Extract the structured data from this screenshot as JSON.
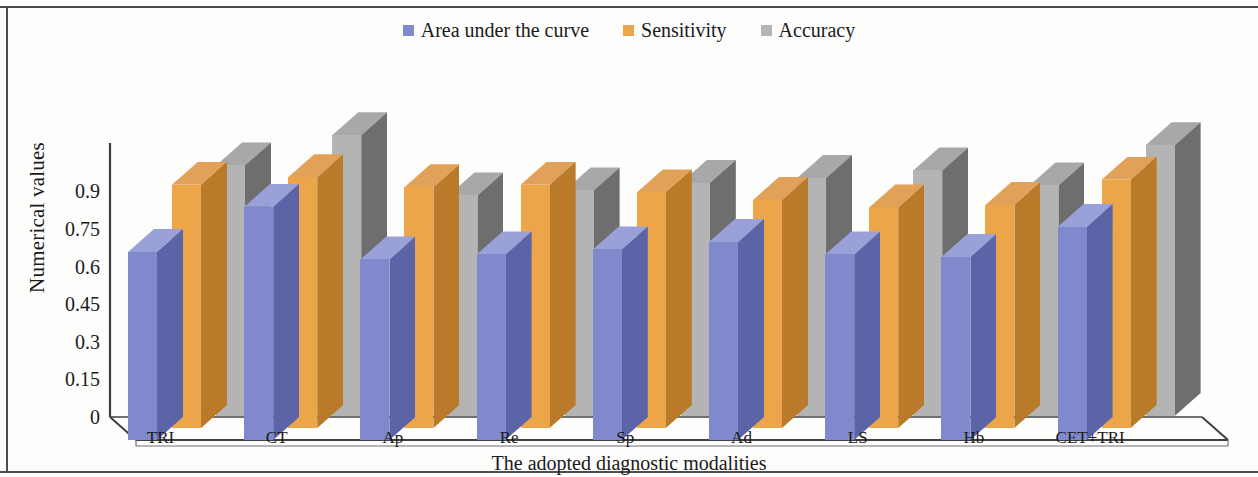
{
  "chart_data": {
    "type": "bar",
    "title": "",
    "xlabel": "The adopted diagnostic modalities",
    "ylabel": "Numerical values",
    "categories": [
      "TRI",
      "CT",
      "Ap",
      "Re",
      "Sp",
      "Ad",
      "LS",
      "Hb",
      "CET+TRI"
    ],
    "series": [
      {
        "name": "Area under the curve",
        "color": "#8189cd",
        "values": [
          0.75,
          0.93,
          0.72,
          0.74,
          0.76,
          0.79,
          0.74,
          0.73,
          0.85
        ]
      },
      {
        "name": "Sensitivity",
        "color": "#eda54a",
        "values": [
          0.97,
          1.0,
          0.96,
          0.97,
          0.94,
          0.91,
          0.88,
          0.89,
          0.99
        ]
      },
      {
        "name": "Accuracy",
        "color": "#b4b4b4",
        "values": [
          1.0,
          1.12,
          0.88,
          0.9,
          0.93,
          0.95,
          0.98,
          0.92,
          1.08
        ]
      }
    ],
    "yticks": [
      "0",
      "0.15",
      "0.3",
      "0.45",
      "0.6",
      "0.75",
      "0.9"
    ],
    "ytick_values": [
      0,
      0.15,
      0.3,
      0.45,
      0.6,
      0.75,
      0.9
    ],
    "ylim": [
      0,
      1.2
    ],
    "grid": false,
    "legend_position": "top-center",
    "projection": "3d"
  },
  "legend": {
    "entries": [
      {
        "label": "Area under the curve",
        "color": "#8189cd"
      },
      {
        "label": "Sensitivity",
        "color": "#eda54a"
      },
      {
        "label": "Accuracy",
        "color": "#b4b4b4"
      }
    ]
  },
  "axes": {
    "y_title": "Numerical values",
    "x_title": "The adopted diagnostic modalities"
  }
}
